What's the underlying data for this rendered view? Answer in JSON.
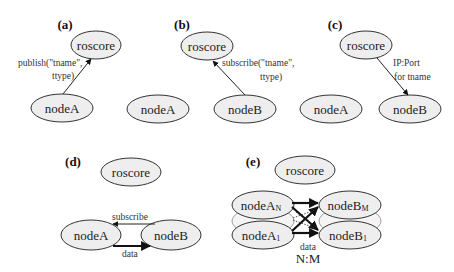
{
  "figure": {
    "panels": [
      {
        "id": "a",
        "label": "(a)",
        "nodes": {
          "roscore": "roscore",
          "nodeA": "nodeA"
        },
        "edges": [
          {
            "from": "nodeA",
            "to": "roscore",
            "label_line1": "publish(\"tname\",",
            "label_line2": "ttype)"
          }
        ]
      },
      {
        "id": "b",
        "label": "(b)",
        "nodes": {
          "roscore": "roscore",
          "nodeA": "nodeA",
          "nodeB": "nodeB"
        },
        "edges": [
          {
            "from": "nodeB",
            "to": "roscore",
            "label_line1": "subscribe(\"tname\",",
            "label_line2": "ttype)"
          }
        ]
      },
      {
        "id": "c",
        "label": "(c)",
        "nodes": {
          "roscore": "roscore",
          "nodeA": "nodeA",
          "nodeB": "nodeB"
        },
        "edges": [
          {
            "from": "roscore",
            "to": "nodeB",
            "label_line1": "IP:Port",
            "label_line2": "for tname"
          }
        ]
      },
      {
        "id": "d",
        "label": "(d)",
        "nodes": {
          "roscore": "roscore",
          "nodeA": "nodeA",
          "nodeB": "nodeB"
        },
        "edges": [
          {
            "from": "nodeB",
            "to": "nodeA",
            "label": "subscribe"
          },
          {
            "from": "nodeA",
            "to": "nodeB",
            "label": "data"
          }
        ]
      },
      {
        "id": "e",
        "label": "(e)",
        "nodes": {
          "roscore": "roscore",
          "nodeAN_base": "nodeA",
          "nodeAN_sub": "N",
          "nodeA1_base": "nodeA",
          "nodeA1_sub": "1",
          "nodeBM_base": "nodeB",
          "nodeBM_sub": "M",
          "nodeB1_base": "nodeB",
          "nodeB1_sub": "1"
        },
        "edges": [
          {
            "from": "nodeA_i",
            "to": "nodeB_j",
            "label": "data",
            "ratio": "N:M"
          }
        ]
      }
    ]
  }
}
